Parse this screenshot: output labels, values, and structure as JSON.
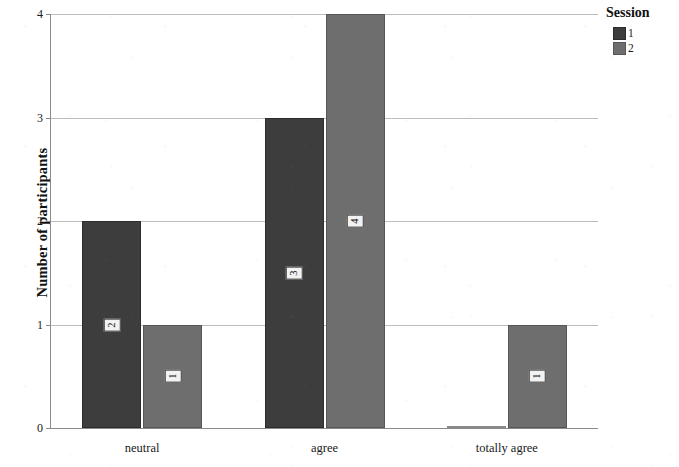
{
  "chart_data": {
    "type": "bar",
    "title": "",
    "xlabel": "",
    "ylabel": "Number of participants",
    "categories": [
      "neutral",
      "agree",
      "totally agree"
    ],
    "series": [
      {
        "name": "1",
        "values": [
          2,
          3,
          0
        ],
        "color": "#3d3d3d"
      },
      {
        "name": "2",
        "values": [
          1,
          4,
          1
        ],
        "color": "#6e6e6e"
      }
    ],
    "ylim": [
      0,
      4
    ],
    "yticks": [
      0,
      1,
      2,
      3,
      4
    ],
    "ytick_labels": [
      "0",
      "1",
      "2",
      "3",
      "4"
    ],
    "grid": true,
    "grid_axis": "y",
    "legend": {
      "title": "Session",
      "position": "right-top",
      "entries": [
        {
          "label": "1",
          "color": "#3d3d3d"
        },
        {
          "label": "2",
          "color": "#6e6e6e"
        }
      ]
    },
    "bar_value_labels": [
      {
        "category": "neutral",
        "series": "1",
        "value": "2"
      },
      {
        "category": "neutral",
        "series": "2",
        "value": "1"
      },
      {
        "category": "agree",
        "series": "1",
        "value": "3"
      },
      {
        "category": "agree",
        "series": "2",
        "value": "4"
      },
      {
        "category": "totally agree",
        "series": "1",
        "value": "0"
      },
      {
        "category": "totally agree",
        "series": "2",
        "value": "1"
      }
    ]
  },
  "axes": {
    "y_title": "Number of participants"
  }
}
